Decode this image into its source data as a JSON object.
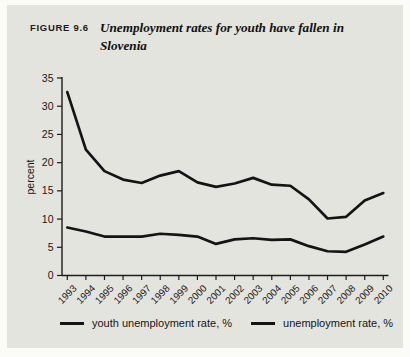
{
  "figure": {
    "label": "FIGURE 9.6",
    "title": "Unemployment rates for youth have fallen in Slovenia"
  },
  "chart_data": {
    "type": "line",
    "title": "Unemployment rates for youth have fallen in Slovenia",
    "x": [
      1993,
      1994,
      1995,
      1996,
      1997,
      1998,
      1999,
      2000,
      2001,
      2002,
      2003,
      2004,
      2005,
      2006,
      2007,
      2008,
      2009,
      2010
    ],
    "series": [
      {
        "name": "youth unemployment rate, %",
        "color": "#141414",
        "values": [
          32.5,
          22.3,
          18.5,
          17.0,
          16.4,
          17.7,
          18.5,
          16.5,
          15.7,
          16.3,
          17.3,
          16.1,
          15.9,
          13.5,
          10.1,
          10.4,
          13.3,
          14.6
        ]
      },
      {
        "name": "unemployment rate, %",
        "color": "#141414",
        "values": [
          8.5,
          7.8,
          6.9,
          6.9,
          6.9,
          7.4,
          7.2,
          6.9,
          5.6,
          6.4,
          6.6,
          6.3,
          6.4,
          5.2,
          4.3,
          4.2,
          5.5,
          6.9
        ]
      }
    ],
    "xlabel": "",
    "ylabel": "percent",
    "ylim": [
      0,
      35
    ],
    "ytick_step": 5,
    "grid": false,
    "legend_position": "bottom"
  },
  "colors": {
    "panel_bg": "#e4e4df",
    "axis": "#1c1c1c",
    "line": "#141414",
    "text": "#161616"
  }
}
